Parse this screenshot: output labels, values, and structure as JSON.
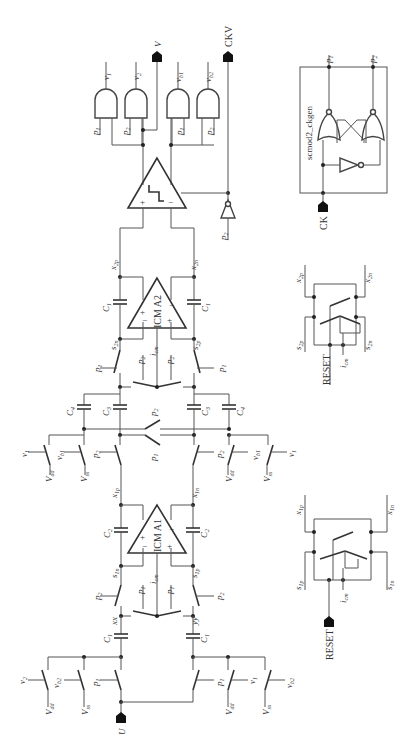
{
  "diagram": {
    "orientation": "rotated-90-ccw",
    "ports": {
      "U": "U",
      "V": "V",
      "CKV": "CKV",
      "CK": "CK",
      "RESET1": "RESET",
      "RESET2": "RESET"
    },
    "amplifiers": {
      "a1": "ICM A1",
      "a2": "ICM A2"
    },
    "block": {
      "ckgen": "scmod2_ckgen",
      "ckgen_out1": "p1",
      "ckgen_out2": "p2"
    },
    "gate_outputs": [
      "v1",
      "v2",
      "vb1",
      "vb2"
    ],
    "gate_inputs": [
      "p1",
      "p2",
      "p1",
      "p2"
    ],
    "capacitors": [
      "C1",
      "C2",
      "C3",
      "C4"
    ],
    "nodes": [
      "xx",
      "yy",
      "x1p",
      "x1n",
      "s1n",
      "s1p",
      "x2p",
      "x2n",
      "s2n",
      "s2p",
      "icm"
    ],
    "refs": [
      "Vdd",
      "Vss",
      "vb1",
      "vb2",
      "v1",
      "v2"
    ],
    "clocks": [
      "p1",
      "p2"
    ]
  }
}
